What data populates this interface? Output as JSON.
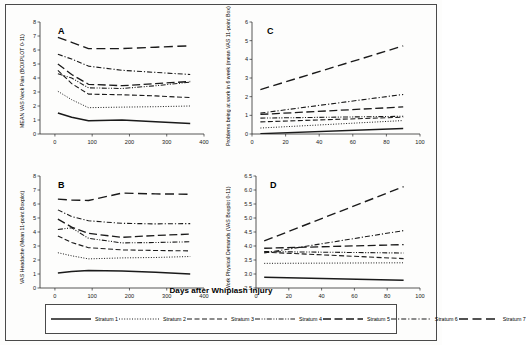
{
  "figure": {
    "xlabel": "Days after Whiplash Injury",
    "panels": [
      "A",
      "B",
      "C",
      "D"
    ]
  },
  "legend": {
    "items": [
      {
        "label": "Stratum 1",
        "style": "solid",
        "dash": "",
        "width": 1.5,
        "color": "#1a1a1a"
      },
      {
        "label": "Stratum 2",
        "style": "dotted",
        "dash": "1,1.6",
        "width": 1.0,
        "color": "#1a1a1a"
      },
      {
        "label": "Stratum 3",
        "style": "dashed",
        "dash": "5,2.5",
        "width": 1.1,
        "color": "#1a1a1a"
      },
      {
        "label": "Stratum 4",
        "style": "dash-dot-dot",
        "dash": "5,1.6,1,1.6,1,1.6",
        "width": 1.1,
        "color": "#1a1a1a"
      },
      {
        "label": "Stratum 5",
        "style": "long-dash",
        "dash": "8,3.5",
        "width": 1.3,
        "color": "#1a1a1a"
      },
      {
        "label": "Stratum 6",
        "style": "dash-dot",
        "dash": "5,2,1.2,2",
        "width": 1.1,
        "color": "#1a1a1a"
      },
      {
        "label": "Stratum 7",
        "style": "long-dash-wide",
        "dash": "9,4.5",
        "width": 1.4,
        "color": "#1a1a1a"
      }
    ]
  },
  "chart_data": [
    {
      "panel": "A",
      "type": "line",
      "title": "A",
      "ylabel": "MEAN VAS Neck Pain (BOXPLOT 0-11)",
      "xlabel": "Days after Whiplash Injury",
      "xlim": [
        -40,
        400
      ],
      "ylim": [
        0,
        8
      ],
      "xticks": [
        0,
        100,
        200,
        300,
        400
      ],
      "yticks": [
        0,
        1,
        2,
        3,
        4,
        5,
        6,
        7,
        8
      ],
      "grid": false,
      "x": [
        8,
        45,
        90,
        180,
        270,
        363
      ],
      "series": [
        {
          "name": "Stratum 1",
          "values": [
            1.5,
            1.2,
            0.95,
            1.0,
            0.88,
            0.75
          ]
        },
        {
          "name": "Stratum 2",
          "values": [
            3.05,
            2.45,
            1.88,
            1.92,
            1.95,
            2.0
          ]
        },
        {
          "name": "Stratum 3",
          "values": [
            4.55,
            3.6,
            2.85,
            2.8,
            2.72,
            2.6
          ]
        },
        {
          "name": "Stratum 4",
          "values": [
            4.3,
            4.0,
            3.3,
            3.25,
            3.45,
            3.7
          ]
        },
        {
          "name": "Stratum 5",
          "values": [
            5.0,
            4.25,
            3.55,
            3.45,
            3.6,
            3.75
          ]
        },
        {
          "name": "Stratum 6",
          "values": [
            5.7,
            5.35,
            4.85,
            4.55,
            4.4,
            4.25
          ]
        },
        {
          "name": "Stratum 7",
          "values": [
            6.9,
            6.55,
            6.1,
            6.1,
            6.2,
            6.3
          ]
        }
      ]
    },
    {
      "panel": "B",
      "type": "line",
      "title": "B",
      "ylabel": "VAS Headache (Mean 11-point Boxplot)",
      "xlabel": "Days after Whiplash Injury",
      "xlim": [
        -40,
        400
      ],
      "ylim": [
        0,
        8
      ],
      "xticks": [
        0,
        100,
        200,
        300,
        400
      ],
      "yticks": [
        0,
        1,
        2,
        3,
        4,
        5,
        6,
        7,
        8
      ],
      "grid": false,
      "x": [
        8,
        45,
        90,
        180,
        270,
        363
      ],
      "series": [
        {
          "name": "Stratum 1",
          "values": [
            1.08,
            1.18,
            1.25,
            1.22,
            1.12,
            1.0
          ]
        },
        {
          "name": "Stratum 2",
          "values": [
            2.52,
            2.3,
            2.08,
            2.15,
            2.18,
            2.25
          ]
        },
        {
          "name": "Stratum 3",
          "values": [
            3.72,
            3.25,
            2.88,
            2.72,
            2.68,
            2.65
          ]
        },
        {
          "name": "Stratum 4",
          "values": [
            4.18,
            4.3,
            3.55,
            3.22,
            3.25,
            3.3
          ]
        },
        {
          "name": "Stratum 5",
          "values": [
            4.92,
            4.35,
            3.9,
            3.62,
            3.75,
            3.85
          ]
        },
        {
          "name": "Stratum 6",
          "values": [
            5.58,
            5.1,
            4.8,
            4.62,
            4.58,
            4.6
          ]
        },
        {
          "name": "Stratum 7",
          "values": [
            6.35,
            6.28,
            6.25,
            6.78,
            6.72,
            6.7
          ]
        }
      ]
    },
    {
      "panel": "C",
      "type": "line",
      "title": "C",
      "ylabel": "Problems being at work in 6 week (mean VAS 11-point Box)",
      "xlabel": "Days after Whiplash Injury",
      "xlim": [
        0,
        100
      ],
      "ylim": [
        0,
        6
      ],
      "xticks": [
        0,
        20,
        40,
        60,
        80,
        100
      ],
      "yticks": [
        0,
        1,
        2,
        3,
        4,
        5,
        6
      ],
      "grid": false,
      "x": [
        5,
        90
      ],
      "series": [
        {
          "name": "Stratum 1",
          "values": [
            0.02,
            0.3
          ]
        },
        {
          "name": "Stratum 2",
          "values": [
            0.32,
            0.72
          ]
        },
        {
          "name": "Stratum 3",
          "values": [
            0.65,
            0.9
          ]
        },
        {
          "name": "Stratum 4",
          "values": [
            0.85,
            0.95
          ]
        },
        {
          "name": "Stratum 5",
          "values": [
            1.05,
            1.45
          ]
        },
        {
          "name": "Stratum 6",
          "values": [
            1.12,
            2.12
          ]
        },
        {
          "name": "Stratum 7",
          "values": [
            2.38,
            4.72
          ]
        }
      ]
    },
    {
      "panel": "D",
      "type": "line",
      "title": "D",
      "ylabel": "Work Physical Demands (VAS Boxplot 0-11)",
      "xlabel": "Days after Whiplash Injury",
      "xlim": [
        0,
        100
      ],
      "ylim": [
        2.5,
        6.5
      ],
      "xticks": [
        0,
        20,
        40,
        60,
        80,
        100
      ],
      "yticks": [
        2.5,
        3.0,
        3.5,
        4.0,
        4.5,
        5.0,
        5.5,
        6.0,
        6.5
      ],
      "ytick_labels": [
        "2.5",
        "3.0",
        "3.5",
        "4.0",
        "4.5",
        "5.0",
        "5.5",
        "6.0",
        "6.5"
      ],
      "grid": false,
      "x": [
        5,
        90
      ],
      "series": [
        {
          "name": "Stratum 1",
          "values": [
            2.88,
            2.78
          ]
        },
        {
          "name": "Stratum 2",
          "values": [
            3.38,
            3.4
          ]
        },
        {
          "name": "Stratum 3",
          "values": [
            3.78,
            3.55
          ]
        },
        {
          "name": "Stratum 4",
          "values": [
            3.8,
            3.75
          ]
        },
        {
          "name": "Stratum 5",
          "values": [
            3.92,
            4.05
          ]
        },
        {
          "name": "Stratum 6",
          "values": [
            3.75,
            4.55
          ]
        },
        {
          "name": "Stratum 7",
          "values": [
            4.18,
            6.12
          ]
        }
      ]
    }
  ]
}
